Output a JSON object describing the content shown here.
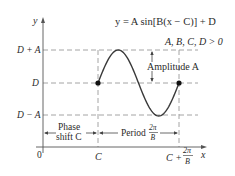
{
  "equation": "y = A sin[B(x − C)] + D",
  "condition": "A, B, C, D > 0",
  "axes": {
    "y_label": "y",
    "x_label": "x",
    "origin_label": "0"
  },
  "y_levels": {
    "top": "D + A",
    "mid": "D",
    "bottom": "D − A"
  },
  "x_marks": {
    "start": "C",
    "end_prefix": "C +",
    "end_fraction_num": "2π",
    "end_fraction_den": "B"
  },
  "annotations": {
    "amplitude": "Amplitude A",
    "phase_line1": "Phase",
    "phase_line2": "shift C",
    "period_prefix": "Period",
    "period_num": "2π",
    "period_den": "B"
  },
  "colors": {
    "curve": "#3a3a3a",
    "dashed": "#9a9a9a",
    "axis": "#555555",
    "text": "#2a2a2a"
  }
}
